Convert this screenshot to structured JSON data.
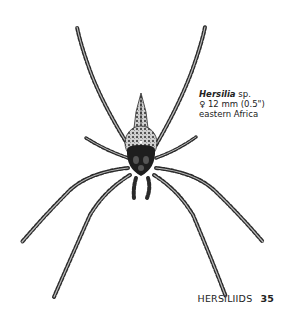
{
  "caption": {
    "genus": "Hersilia",
    "species_suffix": " sp.",
    "sex_symbol": "♀",
    "size": "12 mm (0.5\")",
    "region": "eastern Africa"
  },
  "footer": {
    "family": "HERSILIIDS",
    "page_number": "35"
  },
  "illustration": {
    "subject": "spider-illustration",
    "ink_color": "#1e1e1e",
    "mottle_color": "#8a8a8a"
  }
}
